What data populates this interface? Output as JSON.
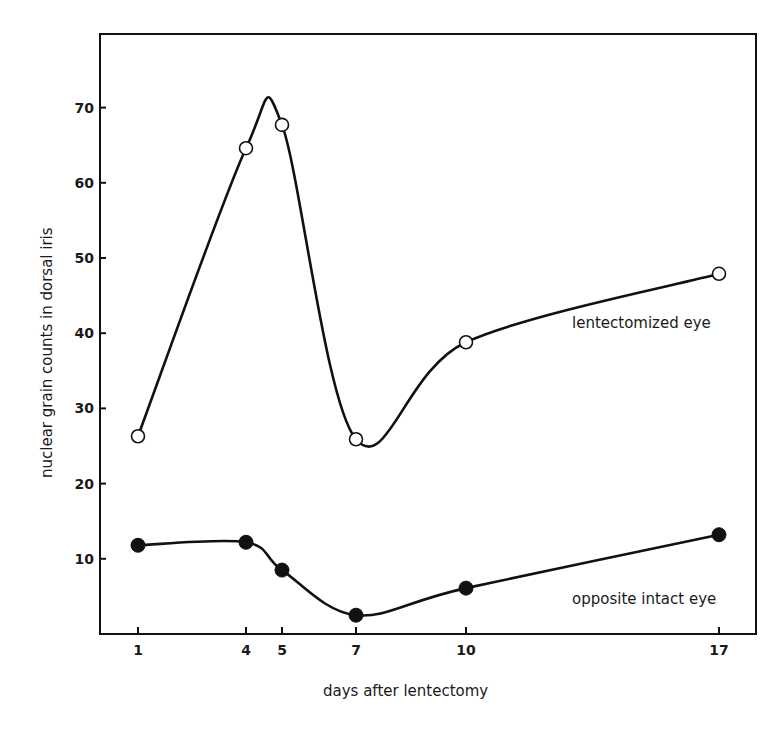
{
  "chart_data": {
    "type": "line",
    "title": "",
    "xlabel": "days after lentectomy",
    "ylabel": "nuclear grain counts in dorsal iris",
    "x": [
      1,
      4,
      5,
      7,
      10,
      17
    ],
    "x_tick_labels": [
      "1",
      "4",
      "5",
      "7",
      "10",
      "17"
    ],
    "y_ticks": [
      10,
      20,
      30,
      40,
      50,
      60,
      70
    ],
    "y_tick_labels": [
      "10",
      "20",
      "30",
      "40",
      "50",
      "60",
      "70"
    ],
    "ylim": [
      0,
      78
    ],
    "grid": false,
    "legend_position": "inline labels near curves",
    "series": [
      {
        "name": "lentectomized eye",
        "marker": "open-circle",
        "values": [
          26.3,
          64.6,
          67.7,
          25.9,
          38.8,
          47.9
        ]
      },
      {
        "name": "opposite intact eye",
        "marker": "filled-circle",
        "values": [
          11.8,
          12.2,
          8.5,
          2.5,
          6.1,
          13.2
        ]
      }
    ]
  }
}
